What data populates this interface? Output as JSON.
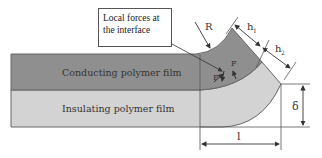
{
  "diagram": {
    "callout": {
      "line1": "Local forces at",
      "line2": "the interface"
    },
    "layers": {
      "conducting": {
        "label": "Conducting polymer film",
        "color": "#8f8f8f"
      },
      "insulating": {
        "label": "Insulating polymer film",
        "color": "#d3d3d3"
      }
    },
    "labels": {
      "radius": "R",
      "h1": "h",
      "h1_sub": "1",
      "h2": "h",
      "h2_sub": "2",
      "force1": "F",
      "force2": "F",
      "deflection": "δ",
      "length": "l"
    },
    "colors": {
      "edge": "#666666",
      "line": "#555555",
      "background": "#ffffff"
    }
  }
}
